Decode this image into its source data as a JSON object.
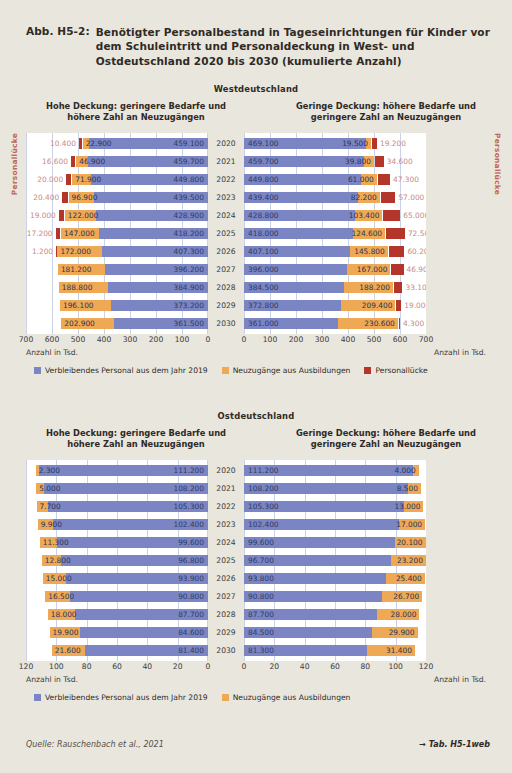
{
  "figure": {
    "number": "Abb. H5-2:",
    "title": "Benötigter Personalbestand in Tageseinrichtungen für Kinder vor dem Schuleintritt und Personaldeckung in West- und Ostdeutschland 2020 bis 2030 (kumulierte Anzahl)",
    "source": "Quelle: Rauschenbach et al., 2021",
    "reference": "→ Tab. H5-1web"
  },
  "colors": {
    "blue": "#7b85c4",
    "orange": "#efa954",
    "red": "#b4362b",
    "paper": "#e9e6dd",
    "plot": "#ffffff",
    "gap_label": "#c0675c"
  },
  "legend": {
    "blue": "Verbleibendes Personal aus dem Jahr 2019",
    "orange": "Neuzugänge aus Ausbildungen",
    "red": "Personallücke"
  },
  "axis_caption": "Anzahl in Tsd.",
  "side_label": "Personallücke",
  "scenarios": {
    "left": "Hohe Deckung: geringere Bedarfe und höhere Zahl an Neuzugängen",
    "right": "Geringe Deckung: höhere Bedarfe und geringere Zahl an Neuzugängen"
  },
  "chart_data": [
    {
      "type": "bar",
      "orientation": "horizontal-diverging-stacked",
      "title": "Westdeutschland",
      "xlabel": "Anzahl in Tsd.",
      "ylabel": "",
      "grid": true,
      "legend_position": "bottom",
      "ticks": [
        700,
        600,
        500,
        400,
        300,
        200,
        100,
        0
      ],
      "xlim": [
        0,
        700
      ],
      "categories": [
        "2020",
        "2021",
        "2022",
        "2023",
        "2024",
        "2025",
        "2026",
        "2027",
        "2028",
        "2029",
        "2030"
      ],
      "panels": {
        "left": {
          "scenario": "Hohe Deckung: geringere Bedarfe und höhere Zahl an Neuzugängen",
          "series": [
            {
              "name": "Verbleibendes Personal aus dem Jahr 2019",
              "color": "#7b85c4",
              "values": [
                459100,
                459700,
                449800,
                439500,
                428900,
                418200,
                407300,
                396200,
                384900,
                373200,
                361500
              ],
              "labels": [
                "459.100",
                "459.700",
                "449.800",
                "439.500",
                "428.900",
                "418.200",
                "407.300",
                "396.200",
                "384.900",
                "373.200",
                "361.500"
              ]
            },
            {
              "name": "Neuzugänge aus Ausbildungen",
              "color": "#efa954",
              "values": [
                22900,
                46900,
                71900,
                96900,
                122000,
                147000,
                172000,
                181200,
                188800,
                196100,
                202900
              ],
              "labels": [
                "22.900",
                "46.900",
                "71.900",
                "96.900",
                "122.000",
                "147.000",
                "172.000",
                "181.200",
                "188.800",
                "196.100",
                "202.900"
              ]
            },
            {
              "name": "Personallücke",
              "color": "#b4362b",
              "values": [
                10400,
                16600,
                20000,
                20400,
                19000,
                17200,
                1200,
                0,
                0,
                0,
                0
              ],
              "labels": [
                "10.400",
                "16.600",
                "20.000",
                "20.400",
                "19.000",
                "17.200",
                "1.200",
                "",
                "",
                "",
                ""
              ]
            }
          ]
        },
        "right": {
          "scenario": "Geringe Deckung: höhere Bedarfe und geringere Zahl an Neuzugängen",
          "series": [
            {
              "name": "Verbleibendes Personal aus dem Jahr 2019",
              "color": "#7b85c4",
              "values": [
                469100,
                459700,
                449800,
                439400,
                428800,
                418000,
                407100,
                396000,
                384500,
                372800,
                361000
              ],
              "labels": [
                "469.100",
                "459.700",
                "449.800",
                "439.400",
                "428.800",
                "418.000",
                "407.100",
                "396.000",
                "384.500",
                "372.800",
                "361.000"
              ]
            },
            {
              "name": "Neuzugänge aus Ausbildungen",
              "color": "#efa954",
              "values": [
                19500,
                39800,
                61000,
                82200,
                103400,
                124600,
                145800,
                167000,
                188200,
                209400,
                230600
              ],
              "labels": [
                "19.500",
                "39.800",
                "61.000",
                "82.200",
                "103.400",
                "124.600",
                "145.800",
                "167.000",
                "188.200",
                "209.400",
                "230.600"
              ]
            },
            {
              "name": "Personallücke",
              "color": "#b4362b",
              "values": [
                19200,
                34600,
                47300,
                57000,
                65000,
                72500,
                60200,
                46900,
                33100,
                19000,
                4300
              ],
              "labels": [
                "19.200",
                "34.600",
                "47.300",
                "57.000",
                "65.000",
                "72.500",
                "60.200",
                "46.900",
                "33.100",
                "19.000",
                "4.300"
              ]
            }
          ]
        }
      }
    },
    {
      "type": "bar",
      "orientation": "horizontal-diverging-stacked",
      "title": "Ostdeutschland",
      "xlabel": "Anzahl in Tsd.",
      "ylabel": "",
      "grid": true,
      "legend_position": "bottom",
      "ticks": [
        120,
        100,
        80,
        60,
        40,
        20,
        0
      ],
      "xlim": [
        0,
        120
      ],
      "categories": [
        "2020",
        "2021",
        "2022",
        "2023",
        "2024",
        "2025",
        "2026",
        "2027",
        "2028",
        "2029",
        "2030"
      ],
      "panels": {
        "left": {
          "scenario": "Hohe Deckung: geringere Bedarfe und höhere Zahl an Neuzugängen",
          "series": [
            {
              "name": "Verbleibendes Personal aus dem Jahr 2019",
              "color": "#7b85c4",
              "values": [
                111200,
                108200,
                105300,
                102400,
                99600,
                96800,
                93900,
                90800,
                87700,
                84600,
                81400
              ],
              "labels": [
                "111.200",
                "108.200",
                "105.300",
                "102.400",
                "99.600",
                "96.800",
                "93.900",
                "90.800",
                "87.700",
                "84.600",
                "81.400"
              ]
            },
            {
              "name": "Neuzugänge aus Ausbildungen",
              "color": "#efa954",
              "values": [
                2300,
                5000,
                7700,
                9900,
                11300,
                12800,
                15000,
                16500,
                18000,
                19900,
                21600
              ],
              "labels": [
                "2.300",
                "5.000",
                "7.700",
                "9.900",
                "11.300",
                "12.800",
                "15.000",
                "16.500",
                "18.000",
                "19.900",
                "21.600"
              ]
            },
            {
              "name": "Personallücke",
              "color": "#b4362b",
              "values": [
                0,
                0,
                0,
                0,
                0,
                0,
                0,
                0,
                0,
                0,
                0
              ],
              "labels": [
                "",
                "",
                "",
                "",
                "",
                "",
                "",
                "",
                "",
                "",
                ""
              ]
            }
          ]
        },
        "right": {
          "scenario": "Geringe Deckung: höhere Bedarfe und geringere Zahl an Neuzugängen",
          "series": [
            {
              "name": "Verbleibendes Personal aus dem Jahr 2019",
              "color": "#7b85c4",
              "values": [
                111200,
                108200,
                105300,
                102400,
                99600,
                96700,
                93800,
                90800,
                87700,
                84500,
                81300
              ],
              "labels": [
                "111.200",
                "108.200",
                "105.300",
                "102.400",
                "99.600",
                "96.700",
                "93.800",
                "90.800",
                "87.700",
                "84.500",
                "81.300"
              ]
            },
            {
              "name": "Neuzugänge aus Ausbildungen",
              "color": "#efa954",
              "values": [
                4000,
                8500,
                13000,
                17000,
                20100,
                23200,
                25400,
                26700,
                28000,
                29900,
                31400
              ],
              "labels": [
                "4.000",
                "8.500",
                "13.000",
                "17.000",
                "20.100",
                "23.200",
                "25.400",
                "26.700",
                "28.000",
                "29.900",
                "31.400"
              ]
            },
            {
              "name": "Personallücke",
              "color": "#b4362b",
              "values": [
                0,
                0,
                0,
                0,
                0,
                0,
                0,
                0,
                0,
                0,
                0
              ],
              "labels": [
                "",
                "",
                "",
                "",
                "",
                "",
                "",
                "",
                "",
                "",
                ""
              ]
            }
          ]
        }
      }
    }
  ]
}
